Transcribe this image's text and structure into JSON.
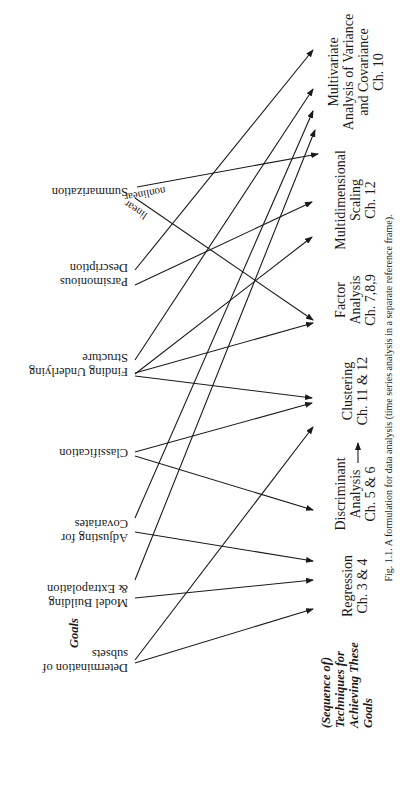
{
  "figure": {
    "caption": "Fig. 1.1. A formulation for data analysis (time series analysis in a separate reference frame).",
    "rotation_deg": 90,
    "colors": {
      "ink": "#1a1a1a",
      "background": "#ffffff"
    }
  },
  "headings": {
    "goals": "Goals",
    "techniques": [
      "(Sequence of)",
      "Techniques for",
      "Achieving These",
      "Goals"
    ]
  },
  "goals": [
    {
      "id": "summarization",
      "lines": [
        "Summarization"
      ],
      "anchor": [
        135,
        192
      ],
      "text_x": 128,
      "text_y": 192
    },
    {
      "id": "parsimonious-description",
      "lines": [
        "Description",
        "Parsimonious"
      ],
      "anchor": [
        135,
        277
      ],
      "text_x": 128,
      "text_y": 268
    },
    {
      "id": "finding-underlying-structure",
      "lines": [
        "Structure",
        "Finding Underlying"
      ],
      "anchor": [
        135,
        366
      ],
      "text_x": 128,
      "text_y": 358
    },
    {
      "id": "classification",
      "lines": [
        "Classification"
      ],
      "anchor": [
        135,
        453
      ],
      "text_x": 128,
      "text_y": 453
    },
    {
      "id": "adjusting-for-covariates",
      "lines": [
        "Covariates",
        "Adjusting for"
      ],
      "anchor": [
        135,
        531
      ],
      "text_x": 128,
      "text_y": 524
    },
    {
      "id": "model-building-extrapolation",
      "lines": [
        "& Extrapolation",
        "Model Building"
      ],
      "anchor": [
        135,
        597
      ],
      "text_x": 128,
      "text_y": 589
    },
    {
      "id": "determination-of-subsets",
      "lines": [
        "subsets",
        "Determination of"
      ],
      "anchor": [
        135,
        662
      ],
      "text_x": 128,
      "text_y": 654
    }
  ],
  "techniques": [
    {
      "id": "regression",
      "lines": [
        "Regression",
        "Ch. 3 & 4"
      ],
      "x": 352,
      "center_y": 586
    },
    {
      "id": "discriminant-analysis",
      "lines": [
        "Discriminant",
        "Analysis",
        "Ch. 5 & 6"
      ],
      "x": 345,
      "center_y": 494
    },
    {
      "id": "clustering",
      "lines": [
        "Clustering",
        "Ch. 11 & 12"
      ],
      "x": 352,
      "center_y": 391
    },
    {
      "id": "factor-analysis",
      "lines": [
        "Factor",
        "Analysis",
        "Ch. 7,8,9"
      ],
      "x": 345,
      "center_y": 300
    },
    {
      "id": "multidimensional-scaling",
      "lines": [
        "Multidimensional",
        "Scaling",
        "Ch. 12"
      ],
      "x": 345,
      "center_y": 200
    },
    {
      "id": "manova",
      "lines": [
        "Multivariate",
        "Analysis of Variance",
        "and Covariance",
        "Ch. 10"
      ],
      "x": 338,
      "center_y": 72
    }
  ],
  "edges": [
    {
      "from": "summarization",
      "start": [
        137,
        187
      ],
      "end": [
        318,
        154
      ],
      "label": "nonlinear",
      "label_pos": [
        165,
        187
      ],
      "label_rot": 170
    },
    {
      "from": "summarization",
      "start": [
        135,
        198
      ],
      "end": [
        313,
        320
      ],
      "label": "linear",
      "label_pos": [
        148,
        214
      ],
      "label_rot": 214
    },
    {
      "from": "parsimonious-description",
      "start": [
        135,
        270
      ],
      "end": [
        313,
        50
      ]
    },
    {
      "from": "parsimonious-description",
      "start": [
        135,
        285
      ],
      "end": [
        312,
        202
      ]
    },
    {
      "from": "finding-underlying-structure",
      "start": [
        135,
        360
      ],
      "end": [
        313,
        89
      ]
    },
    {
      "from": "finding-underlying-structure",
      "start": [
        135,
        373
      ],
      "end": [
        313,
        323
      ]
    },
    {
      "from": "finding-underlying-structure",
      "start": [
        135,
        376
      ],
      "end": [
        312,
        398
      ]
    },
    {
      "from": "classification",
      "start": [
        135,
        452
      ],
      "end": [
        312,
        403
      ]
    },
    {
      "from": "classification",
      "start": [
        135,
        456
      ],
      "end": [
        313,
        510
      ]
    },
    {
      "from": "adjusting-for-covariates",
      "start": [
        135,
        518
      ],
      "end": [
        313,
        111
      ]
    },
    {
      "from": "adjusting-for-covariates",
      "start": [
        135,
        532
      ],
      "end": [
        313,
        561
      ]
    },
    {
      "from": "model-building-extrapolation",
      "start": [
        135,
        580
      ],
      "end": [
        315,
        130
      ]
    },
    {
      "from": "model-building-extrapolation",
      "start": [
        135,
        598
      ],
      "end": [
        313,
        580
      ]
    },
    {
      "from": "determination-of-subsets",
      "start": [
        135,
        660
      ],
      "end": [
        313,
        427
      ]
    },
    {
      "from": "determination-of-subsets",
      "start": [
        135,
        663
      ],
      "end": [
        313,
        609
      ]
    },
    {
      "from": "finding-underlying-structure",
      "start": [
        135,
        374
      ],
      "end": [
        312,
        237
      ]
    }
  ],
  "technique_links": [
    {
      "from": "clustering",
      "to": "discriminant-analysis",
      "start": [
        358,
        463
      ],
      "end": [
        358,
        443
      ],
      "note": "arrow Clustering → Discriminant"
    }
  ]
}
